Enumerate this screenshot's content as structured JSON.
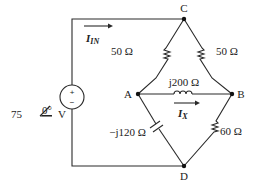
{
  "nodes": {
    "C": "C",
    "A": "A",
    "B": "B",
    "D": "D"
  },
  "source": {
    "magnitude": "75",
    "angle": "0°",
    "unit": "V",
    "plus": "+",
    "minus": "−"
  },
  "components": {
    "R_CA": "50 Ω",
    "R_CB": "50 Ω",
    "L_AB": "j200 Ω",
    "C_AD": "−j120 Ω",
    "R_BD": "60 Ω"
  },
  "currents": {
    "in": {
      "main": "I",
      "sub": "IN"
    },
    "x": {
      "main": "I",
      "sub": "X"
    }
  }
}
